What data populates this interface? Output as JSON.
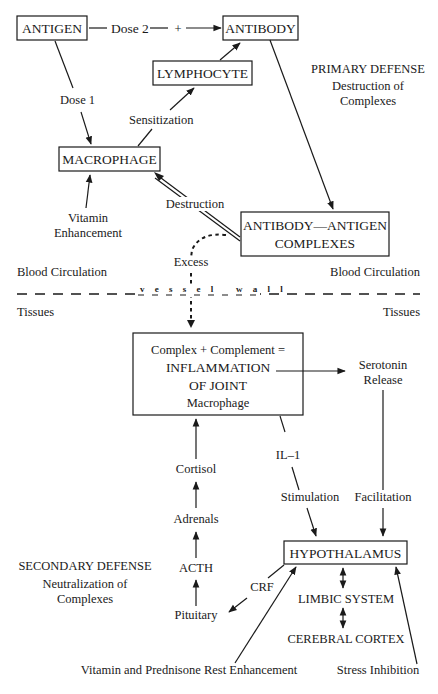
{
  "diagram": {
    "nodes": {
      "antigen": "ANTIGEN",
      "antibody": "ANTIBODY",
      "lymphocyte": "LYMPHOCYTE",
      "macrophage": "MACROPHAGE",
      "complexes_line1": "ANTIBODY—ANTIGEN",
      "complexes_line2": "COMPLEXES",
      "inflammation_line1": "Complex + Complement =",
      "inflammation_line2": "INFLAMMATION",
      "inflammation_line3": "OF JOINT",
      "inflammation_line4": "Macrophage",
      "hypothalamus": "HYPOTHALAMUS",
      "limbic": "LIMBIC SYSTEM",
      "cortex": "CEREBRAL CORTEX",
      "serotonin_line1": "Serotonin",
      "serotonin_line2": "Release",
      "cortisol": "Cortisol",
      "adrenals": "Adrenals",
      "acth": "ACTH",
      "pituitary": "Pituitary"
    },
    "edge_labels": {
      "dose2": "Dose 2",
      "plus": "+",
      "dose1": "Dose 1",
      "sensitization": "Sensitization",
      "destruction": "Destruction",
      "excess": "Excess",
      "vitamin_enh_line1": "Vitamin",
      "vitamin_enh_line2": "Enhancement",
      "il1": "IL–1",
      "stimulation": "Stimulation",
      "facilitation": "Facilitation",
      "crf": "CRF",
      "vitamin_prednisone": "Vitamin and Prednisone Rest Enhancement",
      "stress_inhibition": "Stress Inhibition"
    },
    "annotations": {
      "primary_title": "PRIMARY DEFENSE",
      "primary_sub1": "Destruction of",
      "primary_sub2": "Complexes",
      "secondary_title": "SECONDARY DEFENSE",
      "secondary_sub1": "Neutralization of",
      "secondary_sub2": "Complexes",
      "blood_left": "Blood Circulation",
      "blood_right": "Blood Circulation",
      "tissues_left": "Tissues",
      "tissues_right": "Tissues",
      "vessel_wall": "v e s s e l   w a l l"
    }
  }
}
